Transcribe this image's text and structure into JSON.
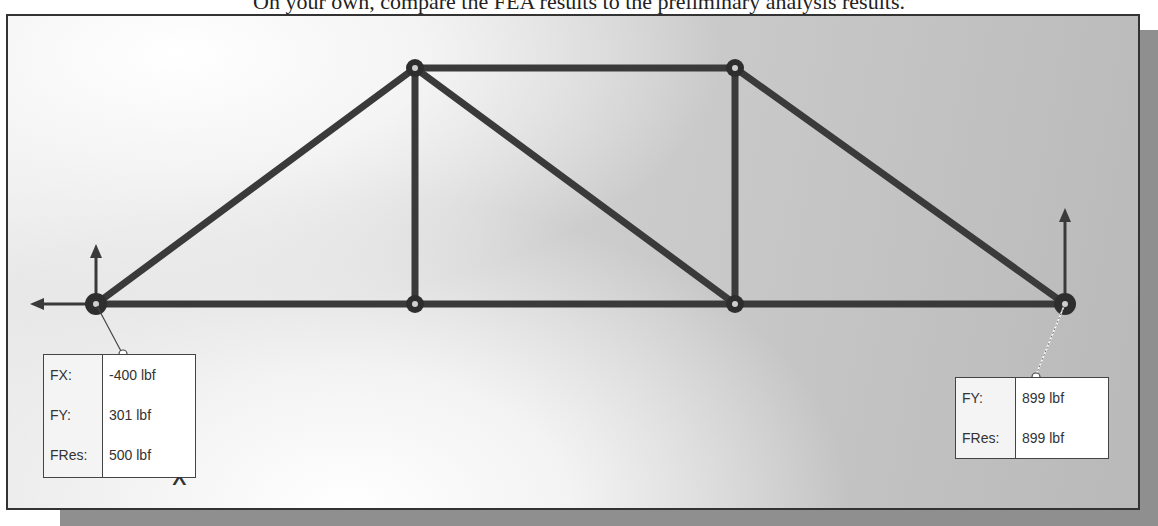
{
  "caption": "On your own, compare the FEA results to the preliminary analysis results.",
  "colors": {
    "member": "#3a3a3a",
    "node": "#2e2e2e",
    "frame_border": "#333333",
    "shadow": "#8f8f8f"
  },
  "truss": {
    "nodes": [
      {
        "id": "N1",
        "x": 96,
        "y": 304,
        "support": true
      },
      {
        "id": "N2",
        "x": 415,
        "y": 68
      },
      {
        "id": "N3",
        "x": 735,
        "y": 68
      },
      {
        "id": "N4",
        "x": 415,
        "y": 304
      },
      {
        "id": "N5",
        "x": 735,
        "y": 304
      },
      {
        "id": "N6",
        "x": 1065,
        "y": 304,
        "support": true
      }
    ],
    "members": [
      [
        "N1",
        "N2"
      ],
      [
        "N2",
        "N3"
      ],
      [
        "N3",
        "N6"
      ],
      [
        "N1",
        "N4"
      ],
      [
        "N4",
        "N5"
      ],
      [
        "N5",
        "N6"
      ],
      [
        "N2",
        "N4"
      ],
      [
        "N2",
        "N5"
      ],
      [
        "N3",
        "N5"
      ]
    ]
  },
  "reaction_left": {
    "rows": [
      {
        "label": "FX:",
        "value": "-400 lbf"
      },
      {
        "label": "FY:",
        "value": "301 lbf"
      },
      {
        "label": "FRes:",
        "value": "500 lbf"
      }
    ]
  },
  "reaction_right": {
    "rows": [
      {
        "label": "FY:",
        "value": "899 lbf"
      },
      {
        "label": "FRes:",
        "value": "899 lbf"
      }
    ]
  },
  "collapse_icon": "chevron-up-icon",
  "collapse_glyph": "^"
}
